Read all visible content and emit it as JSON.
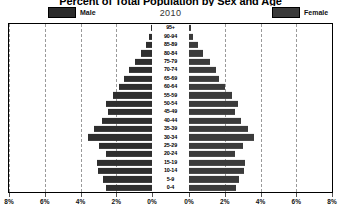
{
  "chart": {
    "title": "Percent of Total Population by Sex and Age",
    "year": "2010"
  },
  "legend": {
    "male_label": "Male",
    "female_label": "Female",
    "male_color": "#2e2e2e",
    "female_color": "#3b3b3b"
  },
  "axis": {
    "tick_labels": [
      "8%",
      "6%",
      "4%",
      "2%",
      "0%",
      "0%",
      "2%",
      "4%",
      "6%",
      "8%"
    ]
  },
  "chart_data": {
    "type": "bar",
    "subtype": "population-pyramid",
    "title": "Percent of Total Population by Sex and Age",
    "subtitle": "2010",
    "xlabel": "",
    "ylabel": "",
    "xlim": [
      0,
      8
    ],
    "xtick_values": [
      8,
      6,
      4,
      2,
      0,
      0,
      2,
      4,
      6,
      8
    ],
    "xtick_labels": [
      "8%",
      "6%",
      "4%",
      "2%",
      "0%",
      "0%",
      "2%",
      "4%",
      "6%",
      "8%"
    ],
    "grid": true,
    "grid_style": "dashed-vertical",
    "legend_position": "top-left-and-top-right",
    "units": "percent of total population",
    "categories": [
      "95+",
      "90-94",
      "85-89",
      "80-84",
      "75-79",
      "70-74",
      "65-69",
      "60-64",
      "55-59",
      "50-54",
      "45-49",
      "40-44",
      "35-39",
      "30-34",
      "25-29",
      "20-24",
      "15-19",
      "10-14",
      "5-9",
      "0-4"
    ],
    "category_order": "top-to-bottom",
    "series": [
      {
        "name": "Male",
        "side": "left",
        "color": "#2e2e2e",
        "values": [
          0.05,
          0.15,
          0.35,
          0.6,
          0.95,
          1.3,
          1.55,
          1.85,
          2.2,
          2.55,
          2.45,
          2.8,
          3.25,
          3.6,
          2.95,
          2.55,
          3.1,
          3.0,
          2.75,
          2.6
        ]
      },
      {
        "name": "Female",
        "side": "right",
        "color": "#3b3b3b",
        "values": [
          0.1,
          0.25,
          0.5,
          0.8,
          1.15,
          1.5,
          1.7,
          2.0,
          2.4,
          2.75,
          2.6,
          2.9,
          3.3,
          3.65,
          3.0,
          2.6,
          3.15,
          3.05,
          2.8,
          2.65
        ]
      }
    ]
  }
}
